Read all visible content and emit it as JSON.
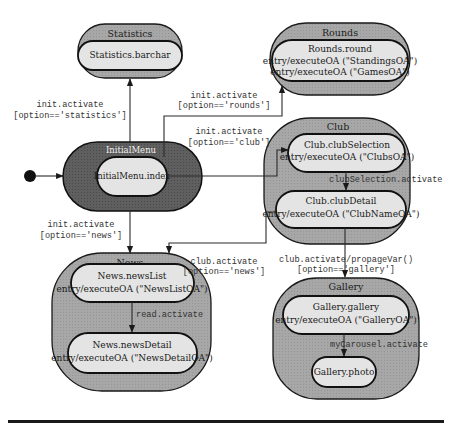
{
  "diagram": {
    "type": "uml-state-machine",
    "colors": {
      "composite_fill": "#a9a9a9",
      "initial_composite_fill": "#5c5c5c",
      "substate_fill": "#e4e4e4",
      "stroke": "#111111"
    },
    "composites": {
      "statistics": {
        "title": "Statistics"
      },
      "rounds": {
        "title": "Rounds"
      },
      "initial_menu": {
        "title": "InitialMenu"
      },
      "club": {
        "title": "Club"
      },
      "news": {
        "title": "News"
      },
      "gallery": {
        "title": "Gallery"
      }
    },
    "states": {
      "statistics_barchar": {
        "name": "Statistics.barchar"
      },
      "rounds_round": {
        "name": "Rounds.round",
        "entry1": "entry/executeOA (\"StandingsOA\")",
        "entry2": "entry/executeOA (\"GamesOA\")"
      },
      "initialmenu_index": {
        "name": "InitialMenu.index"
      },
      "club_selection": {
        "name": "Club.clubSelection",
        "entry": "entry/executeOA (\"ClubsOA\")"
      },
      "club_detail": {
        "name": "Club.clubDetail",
        "entry": "entry/executeOA (\"ClubNameOA\")"
      },
      "news_list": {
        "name": "News.newsList",
        "entry": "entry/executeOA (\"NewsListOA\")"
      },
      "news_detail": {
        "name": "News.newsDetail",
        "entry": "entry/executeOA (\"NewsDetailOA\")"
      },
      "gallery_gallery": {
        "name": "Gallery.gallery",
        "entry": "entry/executeOA (\"GalleryOA\")"
      },
      "gallery_photo": {
        "name": "Gallery.photo"
      }
    },
    "transitions": {
      "to_statistics": {
        "event": "init.activate",
        "guard": "[option=='statistics']"
      },
      "to_rounds": {
        "event": "init.activate",
        "guard": "[option=='rounds']"
      },
      "to_club": {
        "event": "init.activate",
        "guard": "[option=='club']"
      },
      "to_news": {
        "event": "init.activate",
        "guard": "[option=='news']"
      },
      "club_selection_to_detail": {
        "event": "clubSelection.activate"
      },
      "club_to_news": {
        "event": "club.activate",
        "guard": "[option=='news']"
      },
      "club_to_gallery": {
        "event": "club.activate/propageVar()",
        "guard": "[option=='gallery']"
      },
      "news_list_to_detail": {
        "event": "read.activate"
      },
      "gallery_to_photo": {
        "event": "myCarousel.activate"
      }
    }
  }
}
